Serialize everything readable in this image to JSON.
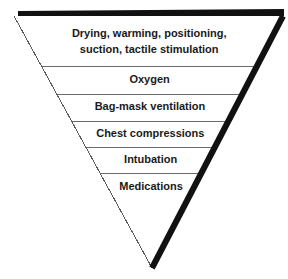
{
  "diagram": {
    "shape": "inverted-triangle",
    "orientation": "apex-down",
    "colors": {
      "background": "#ffffff",
      "thick_edge": "#111111",
      "thin_edge": "#5a5a5a",
      "divider": "#6b6b6b",
      "text": "#1a1a1a"
    },
    "geometry": {
      "top_left_x": 14,
      "top_right_x": 283,
      "top_y": 16,
      "apex_x": 152,
      "apex_y": 268,
      "thick_bar_height": 7,
      "thick_right_edge_width": 6,
      "thin_edge_width": 1,
      "divider_width": 1
    },
    "rows": [
      {
        "label": "Drying, warming, positioning,\nsuction, tactile stimulation",
        "lines": 2,
        "top_y": 16,
        "bottom_y": 66,
        "text_center_y": 42
      },
      {
        "label": "Oxygen",
        "lines": 1,
        "top_y": 66,
        "bottom_y": 94,
        "text_center_y": 80
      },
      {
        "label": "Bag-mask ventilation",
        "lines": 1,
        "top_y": 94,
        "bottom_y": 121,
        "text_center_y": 107
      },
      {
        "label": "Chest compressions",
        "lines": 1,
        "top_y": 121,
        "bottom_y": 147,
        "text_center_y": 134
      },
      {
        "label": "Intubation",
        "lines": 1,
        "top_y": 147,
        "bottom_y": 173,
        "text_center_y": 160
      },
      {
        "label": "Medications",
        "lines": 1,
        "top_y": 173,
        "bottom_y": 199,
        "text_center_y": 187
      }
    ],
    "dividers": [
      66,
      94,
      121,
      147,
      173
    ],
    "font": {
      "row_size_px": 11,
      "first_row_size_px": 11,
      "weight": "bold"
    }
  }
}
